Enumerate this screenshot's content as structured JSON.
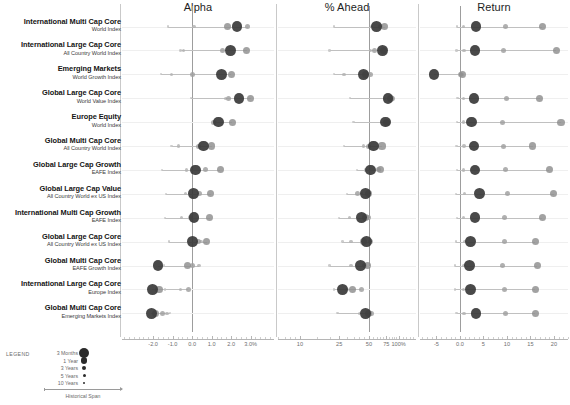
{
  "headers": [
    {
      "key": "alpha",
      "label": "Alpha"
    },
    {
      "key": "ahead",
      "label": "% Ahead"
    },
    {
      "key": "return",
      "label": "Return"
    }
  ],
  "legend": {
    "title": "LEGEND",
    "span_label": "Historical Span",
    "entries": [
      {
        "label": "3 Months",
        "r": 5.2
      },
      {
        "label": "1 Year",
        "r": 3.4
      },
      {
        "label": "3 Years",
        "r": 2.2
      },
      {
        "label": "5 Years",
        "r": 1.5
      },
      {
        "label": "10 Years",
        "r": 1.0
      }
    ]
  },
  "periods": [
    "3 Months",
    "1 Year",
    "3 Years",
    "5 Years",
    "10 Years"
  ],
  "chart_data": {
    "type": "scatter",
    "title": "",
    "panels": [
      {
        "key": "alpha",
        "title": "Alpha",
        "xlabel": "",
        "ylabel": "",
        "xlim": [
          -3.6,
          4.2
        ],
        "zero": 0.0,
        "ticks": [
          {
            "v": -2.0,
            "label": "-2.0"
          },
          {
            "v": -1.0,
            "label": "-1.0"
          },
          {
            "v": 0.0,
            "label": "0.0"
          },
          {
            "v": 1.0,
            "label": "1.0"
          },
          {
            "v": 2.0,
            "label": "2.0"
          },
          {
            "v": 3.0,
            "label": "3.0%"
          }
        ]
      },
      {
        "key": "ahead",
        "title": "% Ahead",
        "xlabel": "",
        "ylabel": "",
        "xlim": [
          6,
          150
        ],
        "log": true,
        "zero": 50,
        "ticks": [
          {
            "v": 10,
            "label": "10"
          },
          {
            "v": 25,
            "label": "25"
          },
          {
            "v": 50,
            "label": "50"
          },
          {
            "v": 75,
            "label": "75"
          },
          {
            "v": 100,
            "label": "100%"
          }
        ]
      },
      {
        "key": "return",
        "title": "Return",
        "xlabel": "",
        "ylabel": "",
        "xlim": [
          -8.5,
          23
        ],
        "zero": 0.0,
        "ticks": [
          {
            "v": -5,
            "label": "-5"
          },
          {
            "v": 0,
            "label": "0.0"
          },
          {
            "v": 5,
            "label": "5"
          },
          {
            "v": 10,
            "label": "10"
          },
          {
            "v": 15,
            "label": "15"
          },
          {
            "v": 20,
            "label": "20"
          }
        ]
      }
    ],
    "rows": [
      {
        "name": "International Multi Cap Core",
        "benchmark": "World Index",
        "alpha": [
          2.3,
          1.8,
          2.85,
          0.1,
          -1.25
        ],
        "ahead": [
          60,
          72,
          65,
          53,
          22
        ],
        "return": [
          3.4,
          17.5,
          9.6,
          0.8,
          -0.6
        ]
      },
      {
        "name": "International Large Cap Core",
        "benchmark": "All Country World Index",
        "alpha": [
          1.95,
          2.8,
          1.55,
          -0.45,
          -0.6
        ],
        "ahead": [
          69,
          70,
          57,
          52,
          20
        ],
        "return": [
          3.2,
          20.5,
          9.3,
          0.9,
          -0.7
        ]
      },
      {
        "name": "Emerging Markets",
        "benchmark": "World Growth Index",
        "alpha": [
          1.5,
          2.0,
          0.0,
          -1.05,
          -1.6
        ],
        "ahead": [
          44,
          46,
          52,
          28,
          22
        ],
        "return": [
          -5.5,
          0.6,
          0.2,
          0.4,
          0.3
        ]
      },
      {
        "name": "Global Large Cap Core",
        "benchmark": "World Value Index",
        "alpha": [
          2.4,
          3.0,
          1.85,
          1.7,
          -0.05
        ],
        "ahead": [
          78,
          82,
          86,
          72,
          32
        ],
        "return": [
          3.0,
          17.0,
          10.0,
          0.7,
          -0.5
        ]
      },
      {
        "name": "Europe Equity",
        "benchmark": "World Index",
        "alpha": [
          1.35,
          2.05,
          1.1,
          1.15,
          1.2
        ],
        "ahead": [
          74,
          76,
          78,
          72,
          35
        ],
        "return": [
          2.4,
          21.5,
          9.0,
          0.8,
          -0.6
        ]
      },
      {
        "name": "Global Multi Cap Core",
        "benchmark": "All Country World Index",
        "alpha": [
          0.6,
          1.0,
          0.3,
          -0.7,
          -1.05
        ],
        "ahead": [
          56,
          68,
          50,
          44,
          28
        ],
        "return": [
          3.0,
          15.5,
          9.2,
          0.9,
          -0.7
        ]
      },
      {
        "name": "Global Large Cap Growth",
        "benchmark": "EAFE Index",
        "alpha": [
          0.18,
          1.45,
          0.7,
          -0.3,
          -1.55
        ],
        "ahead": [
          52,
          66,
          63,
          46,
          38
        ],
        "return": [
          3.2,
          19.0,
          9.8,
          0.8,
          -0.6
        ]
      },
      {
        "name": "Global Large Cap Value",
        "benchmark": "All Country World ex US Index",
        "alpha": [
          0.08,
          0.95,
          0.4,
          -0.35,
          -1.35
        ],
        "ahead": [
          46,
          50,
          38,
          42,
          30
        ],
        "return": [
          4.2,
          20.0,
          10.2,
          1.0,
          -0.8
        ]
      },
      {
        "name": "International Multi Cap Growth",
        "benchmark": "EAFE Index",
        "alpha": [
          0.1,
          0.9,
          -0.1,
          -0.55,
          -1.4
        ],
        "ahead": [
          42,
          46,
          50,
          32,
          25
        ],
        "return": [
          3.2,
          17.5,
          9.4,
          0.8,
          -0.6
        ]
      },
      {
        "name": "Global Large Cap Core",
        "benchmark": "All Country World ex US Index",
        "alpha": [
          0.0,
          0.75,
          0.3,
          0.45,
          -1.2
        ],
        "ahead": [
          47,
          44,
          52,
          33,
          27
        ],
        "return": [
          2.2,
          16.0,
          9.5,
          1.1,
          -0.9
        ]
      },
      {
        "name": "Global Multi Cap Core",
        "benchmark": "EAFE Growth Index",
        "alpha": [
          -1.75,
          -0.25,
          0.0,
          0.35,
          -1.45
        ],
        "ahead": [
          41,
          48,
          45,
          33,
          20
        ],
        "return": [
          2.0,
          16.5,
          9.1,
          0.9,
          -1.1
        ]
      },
      {
        "name": "International Large Cap Core",
        "benchmark": "Europe Index",
        "alpha": [
          -2.05,
          -1.7,
          -0.2,
          -0.6,
          -1.4
        ],
        "ahead": [
          27,
          34,
          42,
          30,
          22
        ],
        "return": [
          2.2,
          16.0,
          9.4,
          0.8,
          -1.0
        ]
      },
      {
        "name": "Global Multi Cap Core",
        "benchmark": "Emerging Markets Index",
        "alpha": [
          -2.1,
          -1.9,
          -1.5,
          -1.3,
          -1.15
        ],
        "ahead": [
          46,
          50,
          53,
          40,
          24
        ],
        "return": [
          3.4,
          16.0,
          9.6,
          0.9,
          -0.7
        ]
      }
    ]
  }
}
